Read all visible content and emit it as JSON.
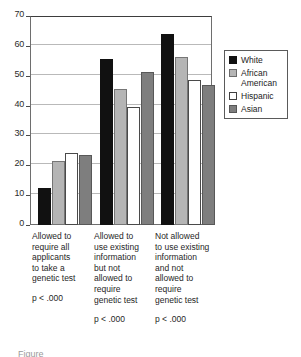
{
  "chart_data": {
    "type": "bar",
    "title": "",
    "subtitle": "",
    "xlabel": "",
    "ylabel": "",
    "ylim": [
      0,
      70
    ],
    "yticks": [
      0,
      10,
      20,
      30,
      40,
      50,
      60,
      70
    ],
    "grid": true,
    "legend_position": "right",
    "categories": [
      "Allowed to\nrequire all\napplicants\nto take a\ngenetic test",
      "Allowed to\nuse existing\ninformation\nbut not\nallowed to\nrequire\ngenetic test",
      "Not allowed\nto use existing\ninformation\nand not\nallowed  to\nrequire\ngenetic test"
    ],
    "annotations": [
      "p < .000",
      "p < .000",
      "p < .000"
    ],
    "series": [
      {
        "name": "White",
        "color": "#111111",
        "values": [
          12.5,
          55.5,
          64.0
        ]
      },
      {
        "name": "African\nAmerican",
        "color": "#b5b5b5",
        "values": [
          21.5,
          45.5,
          56.2
        ]
      },
      {
        "name": "Hispanic",
        "color": "#ffffff",
        "values": [
          24.0,
          39.5,
          48.7
        ]
      },
      {
        "name": "Asian",
        "color": "#7e7e7e",
        "values": [
          23.3,
          51.3,
          47.0
        ]
      }
    ]
  },
  "axis": {
    "y_tick_labels": [
      "70",
      "60",
      "50",
      "40",
      "30",
      "20",
      "10",
      "0"
    ]
  },
  "legend": {
    "entries": [
      {
        "label": "White"
      },
      {
        "label": "African\nAmerican"
      },
      {
        "label": "Hispanic"
      },
      {
        "label": "Asian"
      }
    ]
  },
  "categories": [
    {
      "text": "Allowed to\nrequire all\napplicants\nto take a\ngenetic test",
      "pvalue": "p < .000"
    },
    {
      "text": "Allowed to\nuse existing\ninformation\nbut not\nallowed to\nrequire\ngenetic test",
      "pvalue": "p < .000"
    },
    {
      "text": "Not allowed\nto use existing\ninformation\nand not\nallowed  to\nrequire\ngenetic test",
      "pvalue": "p < .000"
    }
  ],
  "caption": {
    "stub": "Figure"
  }
}
